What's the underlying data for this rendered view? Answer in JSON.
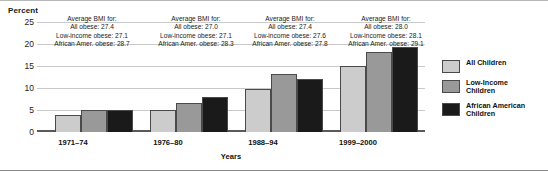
{
  "chart_data": {
    "type": "bar",
    "title": "",
    "ylabel": "Percent",
    "xlabel": "Years",
    "categories": [
      "1971–74",
      "1976–80",
      "1988–94",
      "1999–2000"
    ],
    "ylim": [
      0,
      25
    ],
    "yticks": [
      0,
      5,
      10,
      15,
      20,
      25
    ],
    "ytick_labels": [
      "0",
      "5",
      "10",
      "15",
      "20",
      "25"
    ],
    "grid": true,
    "legend_position": "right",
    "series": [
      {
        "name": "All Children",
        "color": "#cccccc",
        "values": [
          4.0,
          5.2,
          10.0,
          15.2
        ]
      },
      {
        "name": "Low-Income Children",
        "color": "#999999",
        "values": [
          5.0,
          6.8,
          13.5,
          18.6
        ]
      },
      {
        "name": "African American Children",
        "color": "#1a1a1a",
        "values": [
          5.0,
          8.0,
          12.2,
          19.6
        ]
      }
    ],
    "annotations": [
      {
        "group": "1971–74",
        "line1": "Average BMI for:",
        "line2": "All obese: 27.4",
        "line3": "Low-income obese: 27.1",
        "line4": "African Amer. obese: 28.7"
      },
      {
        "group": "1976–80",
        "line1": "Average BMI for:",
        "line2": "All obese: 27.0",
        "line3": "Low-income obese: 27.1",
        "line4": "African Amer. obese: 28.3"
      },
      {
        "group": "1988–94",
        "line1": "Average BMI for:",
        "line2": "All obese: 27.4",
        "line3": "Low-income obese: 27.6",
        "line4": "African Amer. obese: 27.8"
      },
      {
        "group": "1999–2000",
        "line1": "Average BMI for:",
        "line2": "All obese: 28.0",
        "line3": "Low-income obese: 28.1",
        "line4": "African Amer. obese: 29.1"
      }
    ]
  },
  "axes": {
    "y_title": "Percent",
    "x_title": "Years",
    "y_ticks": [
      "25",
      "20",
      "15",
      "10",
      "5",
      "0"
    ],
    "x_ticks": [
      "1971–74",
      "1976–80",
      "1988–94",
      "1999–2000"
    ]
  },
  "legend": {
    "items": [
      {
        "label": "All Children",
        "color": "#cccccc"
      },
      {
        "label": "Low-Income\nChildren",
        "color": "#999999"
      },
      {
        "label": "African American\nChildren",
        "color": "#1a1a1a"
      }
    ]
  },
  "annotations": [
    {
      "line1": "Average BMI for:",
      "line2": "All obese: 27.4",
      "line3": "Low-income obese: 27.1",
      "line4": "African Amer. obese: 28.7"
    },
    {
      "line1": "Average BMI for:",
      "line2": "All obese: 27.0",
      "line3": "Low-income obese: 27.1",
      "line4": "African Amer. obese: 28.3"
    },
    {
      "line1": "Average BMI for:",
      "line2": "All obese: 27.4",
      "line3": "Low-income obese: 27.6",
      "line4": "African Amer. obese: 27.8"
    },
    {
      "line1": "Average BMI for:",
      "line2": "All obese: 28.0",
      "line3": "Low-income obese: 28.1",
      "line4": "African Amer. obese: 29.1"
    }
  ]
}
